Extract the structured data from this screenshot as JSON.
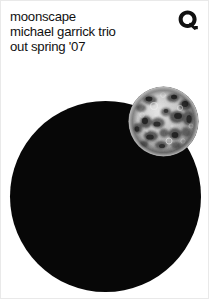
{
  "poster": {
    "background_color": "#ffffff",
    "width": 209,
    "height": 299
  },
  "headline": {
    "title": "moonscape",
    "artist": "michael garrick trio",
    "release": "out spring '07",
    "text_color": "#111111"
  },
  "logo": {
    "name": "record-label-logo",
    "shape": "circular-q-ring",
    "color": "#111111"
  },
  "artwork": {
    "black_disc": {
      "name": "black-disc",
      "color": "#070707",
      "center_x": 104,
      "center_y": 195,
      "radius": 95
    },
    "moon": {
      "name": "moon-photograph",
      "center_x": 162,
      "center_y": 120,
      "radius": 35,
      "description": "grayscale full moon photograph with craters and maria",
      "highlight_color": "#e8e8e8",
      "shadow_color": "#2b2b2b",
      "base_color": "#9a9a9a"
    }
  }
}
